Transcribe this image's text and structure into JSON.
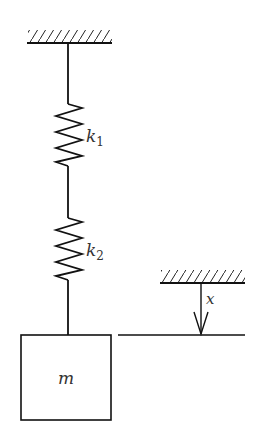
{
  "diagram": {
    "type": "mechanical-spring-mass",
    "springs": [
      {
        "label": "k",
        "subscript": "1"
      },
      {
        "label": "k",
        "subscript": "2"
      }
    ],
    "mass": {
      "label": "m"
    },
    "displacement": {
      "label": "x",
      "direction": "down"
    },
    "colors": {
      "stroke": "#111111",
      "label": "#333333",
      "background": "#ffffff"
    }
  }
}
